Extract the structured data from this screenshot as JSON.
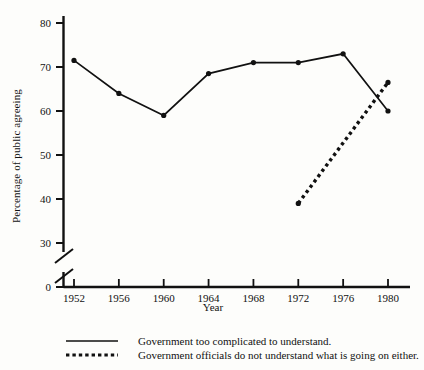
{
  "chart_data": {
    "type": "line",
    "title": "",
    "xlabel": "Year",
    "ylabel": "Percentage of public agreeing",
    "categories": [
      1952,
      1956,
      1960,
      1964,
      1968,
      1972,
      1976,
      1980
    ],
    "xticklabels": [
      "1952",
      "1956",
      "1960",
      "1964",
      "1968",
      "1972",
      "1976",
      "1980"
    ],
    "yticklabels": [
      "0",
      "30",
      "40",
      "50",
      "60",
      "70",
      "80"
    ],
    "yticks": [
      0,
      30,
      40,
      50,
      60,
      70,
      80
    ],
    "ylim": [
      0,
      85
    ],
    "axis_break": true,
    "axis_break_note": "y-axis broken between 0 and 30",
    "grid": false,
    "legend_position": "below-plot",
    "series": [
      {
        "name": "Government too complicated to understand.",
        "style": "solid",
        "marker": "filled-circle",
        "x": [
          1952,
          1956,
          1960,
          1964,
          1968,
          1972,
          1976,
          1980
        ],
        "values": [
          71.5,
          64,
          59,
          68.5,
          71,
          71,
          73,
          60
        ]
      },
      {
        "name": "Government officials do not understand what is going on either.",
        "style": "dotted",
        "marker": "filled-circle",
        "x": [
          1972,
          1980
        ],
        "values": [
          39,
          66.5
        ]
      }
    ]
  },
  "legend": {
    "items": [
      {
        "label": "Government too complicated to understand.",
        "style": "solid"
      },
      {
        "label": "Government officials do not understand what is going on either.",
        "style": "dotted"
      }
    ]
  },
  "colors": {
    "ink": "#111111",
    "background": "#fdfdfb"
  }
}
